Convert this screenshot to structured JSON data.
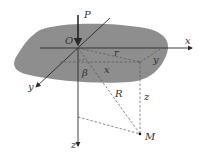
{
  "diagram": {
    "colors": {
      "surface": "#8e8e8e",
      "line": "#2a2a2a",
      "dashed": "#555555",
      "background": "#ffffff"
    },
    "labels": {
      "force": "P",
      "origin": "O",
      "x_axis": "x",
      "y_axis": "y",
      "z_axis": "z",
      "radial_distance": "r",
      "x_component": "x",
      "y_component": "y",
      "z_component": "z",
      "distance": "R",
      "angle": "β",
      "point": "M"
    }
  }
}
